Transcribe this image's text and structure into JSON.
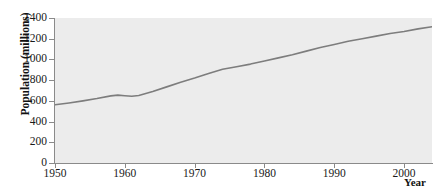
{
  "chart_data": {
    "type": "line",
    "title": "",
    "subtitle": "",
    "xlabel": "Year",
    "ylabel": "Population (millions)",
    "xlim": [
      1950,
      2004
    ],
    "ylim": [
      0,
      1400
    ],
    "grid": false,
    "legend": "none",
    "x_ticks": [
      1950,
      1960,
      1970,
      1980,
      1990,
      2000
    ],
    "x_tick_labels": [
      "1950",
      "1960",
      "1970",
      "1980",
      "1990",
      "2000"
    ],
    "y_ticks": [
      0,
      200,
      400,
      600,
      800,
      1000,
      1200,
      1400
    ],
    "y_tick_labels": [
      "0",
      "200",
      "400",
      "600",
      "800",
      "1000",
      "1200",
      "1400"
    ],
    "series": [
      {
        "name": "Population",
        "color": "#7d7d7d",
        "line_width": 1.6,
        "x": [
          1950,
          1952,
          1954,
          1956,
          1958,
          1959,
          1960,
          1961,
          1962,
          1964,
          1966,
          1968,
          1970,
          1972,
          1974,
          1976,
          1978,
          1980,
          1982,
          1984,
          1986,
          1988,
          1990,
          1992,
          1994,
          1996,
          1998,
          2000,
          2002,
          2004
        ],
        "values": [
          563,
          580,
          600,
          622,
          648,
          655,
          650,
          645,
          652,
          690,
          735,
          780,
          820,
          865,
          905,
          930,
          955,
          985,
          1015,
          1045,
          1080,
          1115,
          1145,
          1175,
          1200,
          1225,
          1250,
          1270,
          1295,
          1315
        ]
      }
    ],
    "panel_background": "#ececec",
    "axis_color": "#8a8a8a",
    "text_color": "#1a1a1a"
  },
  "axis": {
    "y_title": "Population (millions)",
    "x_title": "Year"
  }
}
